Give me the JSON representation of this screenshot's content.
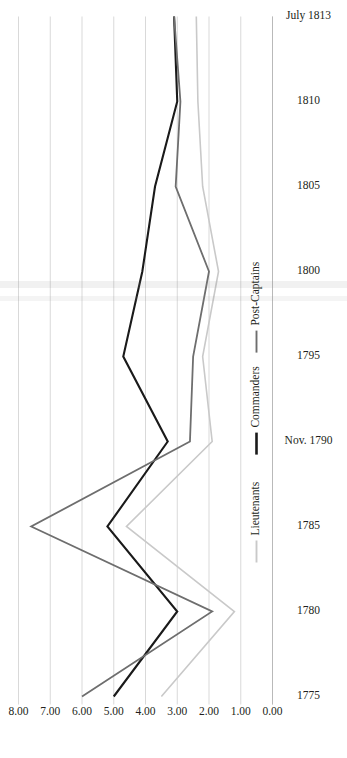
{
  "figure": {
    "orientation": "rotated-90",
    "background": "#ffffff"
  },
  "chart_data": {
    "type": "line",
    "title": "",
    "subtitle": "",
    "xlabel": "",
    "ylabel": "",
    "grid": true,
    "legend_position": "inside-right",
    "categories": [
      "1775",
      "1780",
      "1785",
      "Nov. 1790",
      "1795",
      "1800",
      "1805",
      "1810",
      "July 1813"
    ],
    "xtick_labels": [
      "1775",
      "1780",
      "1785",
      "Nov. 1790",
      "1795",
      "1800",
      "1805",
      "1810",
      "July 1813"
    ],
    "ytick_labels": [
      "0.00",
      "1.00",
      "2.00",
      "3.00",
      "4.00",
      "5.00",
      "6.00",
      "7.00",
      "8.00"
    ],
    "ytick_values": [
      0,
      1,
      2,
      3,
      4,
      5,
      6,
      7,
      8
    ],
    "ylim": [
      0,
      8
    ],
    "series": [
      {
        "name": "Lieutenants",
        "color": "#c9c9c9",
        "stroke_width": 1.6,
        "values": [
          3.5,
          1.2,
          4.6,
          1.9,
          2.2,
          1.7,
          2.2,
          2.35,
          2.4
        ]
      },
      {
        "name": "Commanders",
        "color": "#1a1a1a",
        "stroke_width": 2.1,
        "values": [
          5.0,
          3.0,
          5.2,
          3.3,
          4.7,
          4.1,
          3.7,
          3.0,
          3.1
        ]
      },
      {
        "name": "Post-Captains",
        "color": "#6e6e6e",
        "stroke_width": 1.8,
        "values": [
          6.0,
          1.9,
          7.6,
          2.6,
          2.5,
          2.0,
          3.05,
          2.9,
          3.1
        ]
      }
    ]
  },
  "legend": {
    "items": [
      {
        "label": "Lieutenants",
        "color": "#c9c9c9"
      },
      {
        "label": "Commanders",
        "color": "#1a1a1a"
      },
      {
        "label": "Post-Captains",
        "color": "#6e6e6e"
      }
    ]
  }
}
